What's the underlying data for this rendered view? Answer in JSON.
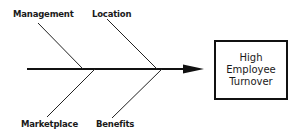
{
  "diagram": {
    "type": "fishbone",
    "effect": {
      "lines": [
        "High",
        "Employee",
        "Turnover"
      ]
    },
    "causes": {
      "top": [
        {
          "label": "Management"
        },
        {
          "label": "Location"
        }
      ],
      "bottom": [
        {
          "label": "Marketplace"
        },
        {
          "label": "Benefits"
        }
      ]
    },
    "colors": {
      "line": "#111111",
      "text": "#1a1a1a",
      "background": "#ffffff"
    }
  }
}
